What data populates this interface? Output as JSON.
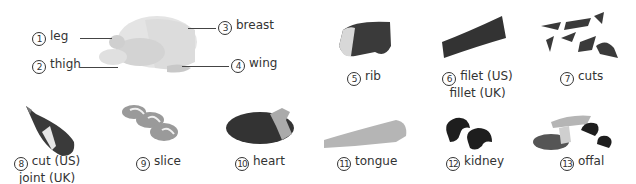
{
  "items": [
    {
      "num": "1",
      "label": "leg"
    },
    {
      "num": "2",
      "label": "thigh"
    },
    {
      "num": "3",
      "label": "breast"
    },
    {
      "num": "4",
      "label": "wing"
    },
    {
      "num": "5",
      "label": "rib"
    },
    {
      "num": "6",
      "label": "filet (US)",
      "label2": "fillet (UK)"
    },
    {
      "num": "7",
      "label": "cuts"
    },
    {
      "num": "8",
      "label": "cut (US)",
      "label2": "joint (UK)"
    },
    {
      "num": "9",
      "label": "slice"
    },
    {
      "num": "10",
      "label": "heart"
    },
    {
      "num": "11",
      "label": "tongue"
    },
    {
      "num": "12",
      "label": "kidney"
    },
    {
      "num": "13",
      "label": "offal"
    }
  ],
  "colors": {
    "meat_dark": "#3a3a3a",
    "meat_mid": "#8a8a8a",
    "fat": "#e8e8e8",
    "poultry": "#d9d9d9"
  }
}
